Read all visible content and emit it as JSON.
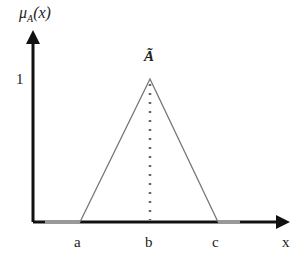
{
  "diagram": {
    "type": "triangular-fuzzy-membership-function",
    "y_axis_label": "μ",
    "y_axis_sub": "A",
    "y_axis_arg": "(x)",
    "y_tick": "1",
    "peak_label": "Ã",
    "x_axis_label": "x",
    "x_ticks": [
      "a",
      "b",
      "c"
    ],
    "colors": {
      "axis": "#111111",
      "triangle": "#777777",
      "dotted": "#666666",
      "support_segment": "#999999"
    }
  }
}
